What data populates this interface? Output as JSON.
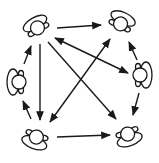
{
  "diagram": {
    "colors": {
      "stroke": "#1a1a1a",
      "background": "#ffffff"
    },
    "nodes": [
      {
        "id": "A",
        "label": "",
        "position": "top-left",
        "x": 37,
        "y": 27,
        "rotation": -30
      },
      {
        "id": "B",
        "label": "",
        "position": "top-right",
        "x": 121,
        "y": 23,
        "rotation": 25
      },
      {
        "id": "C",
        "label": "",
        "position": "right",
        "x": 141,
        "y": 75,
        "rotation": 90
      },
      {
        "id": "D",
        "label": "",
        "position": "left",
        "x": 18,
        "y": 82,
        "rotation": -90
      },
      {
        "id": "E",
        "label": "",
        "position": "bottom-left",
        "x": 36,
        "y": 137,
        "rotation": -160
      },
      {
        "id": "F",
        "label": "",
        "position": "bottom-right",
        "x": 128,
        "y": 134,
        "rotation": 160
      }
    ],
    "edges": [
      {
        "from": "A",
        "to": "B",
        "bidirectional": false
      },
      {
        "from": "A",
        "to": "C",
        "bidirectional": true
      },
      {
        "from": "A",
        "to": "E",
        "bidirectional": false
      },
      {
        "from": "A",
        "to": "F",
        "bidirectional": false
      },
      {
        "from": "E",
        "to": "B",
        "bidirectional": true
      },
      {
        "from": "E",
        "to": "F",
        "bidirectional": false
      },
      {
        "from": "D",
        "to": "A",
        "bidirectional": false
      },
      {
        "from": "E",
        "to": "D",
        "bidirectional": false
      },
      {
        "from": "C",
        "to": "B",
        "bidirectional": false
      },
      {
        "from": "C",
        "to": "F",
        "bidirectional": false
      }
    ]
  }
}
